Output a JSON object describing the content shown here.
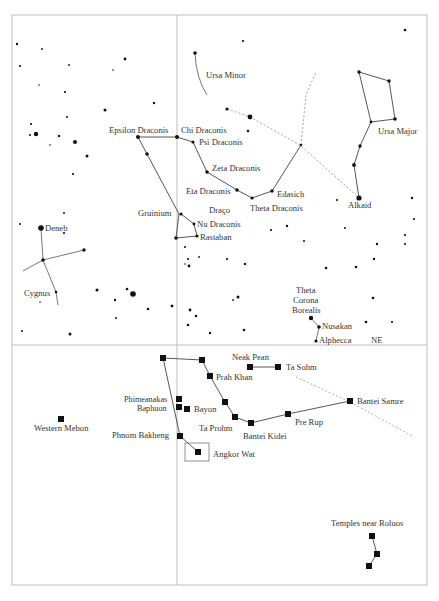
{
  "figure": {
    "frame": {
      "left": 12,
      "top": 15,
      "right": 427,
      "bottom": 585
    },
    "dividers": {
      "vertical_x": 177,
      "horizontal_y": 345
    },
    "colors": {
      "ink": "#111111",
      "frame": "#bdbdbd",
      "line": "#555555",
      "dashed": "#9a9a9a",
      "text": "#333333"
    }
  },
  "sky": {
    "constellation_labels": {
      "ursa_minor": "Ursa Minor",
      "ursa_major": "Ursa Major",
      "draco": "Draço",
      "cygnus": "Cygnus",
      "corona_borealis": [
        "Theta",
        "Corona",
        "Borealis"
      ]
    },
    "star_labels": {
      "epsilon_draconis": "Epsilon Draconis",
      "chi_draconis": "Chi Draconis",
      "psi_draconis": "Psi Draconis",
      "zeta_draconis": "Zeta Draconis",
      "eta_draconis": "Eta Draconis",
      "theta_draconis": "Theta Draconis",
      "edasich": "Edasich",
      "gruinium": "Gruinium",
      "nu_draconis": "Nu Draconis",
      "rastaban": "Rastaban",
      "deneb": "Deneb",
      "alkaid": "Alkaid",
      "nusakan": "Nusakan",
      "alphecca": "Alphecca"
    },
    "direction_label": "NE"
  },
  "ground": {
    "temple_labels": {
      "neak_pean": "Neak Pean",
      "ta_sohm": "Ta Sohm",
      "prah_khan": "Prah Khan",
      "phimeanakas": "Phimeanakas",
      "baphuon": "Baphuon",
      "bayon": "Bayon",
      "ta_prohm": "Ta Prohm",
      "bantei_kidei": "Bantei Kidei",
      "pre_rup": "Pre Rup",
      "bantei_samre": "Bantei Samre",
      "western_mebon": "Western Mebon",
      "phnom_bakheng": "Phnom Bakheng",
      "angkor_wat": "Angkor Wat",
      "temples_near_roluos": "Temples near Roluos"
    }
  }
}
